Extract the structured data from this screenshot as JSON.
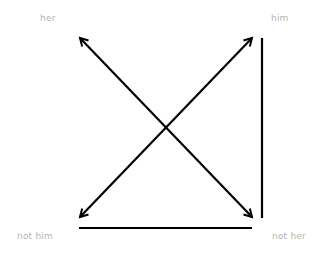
{
  "diagram": {
    "type": "semiotic-square",
    "line_color": "#000000",
    "label_color": "#b4b4b4",
    "corners": {
      "top_left": "her",
      "top_right": "him",
      "bottom_left": "not him",
      "bottom_right": "not her"
    },
    "relations": [
      {
        "from": "her",
        "to": "not her",
        "kind": "double-arrow",
        "meaning": "contradiction"
      },
      {
        "from": "him",
        "to": "not him",
        "kind": "double-arrow",
        "meaning": "contradiction"
      },
      {
        "from": "him",
        "to": "not her",
        "kind": "line",
        "meaning": "implication"
      },
      {
        "from": "not him",
        "to": "not her",
        "kind": "line",
        "meaning": "sub-contrary"
      }
    ]
  }
}
